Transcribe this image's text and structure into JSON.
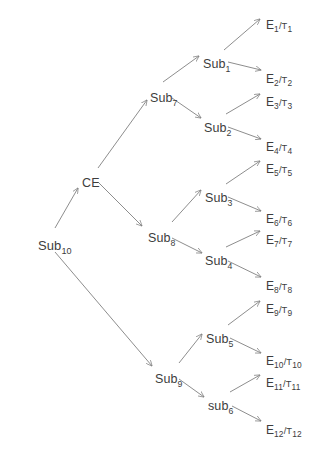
{
  "diagram": {
    "type": "tree",
    "background_color": "#ffffff",
    "text_color": "#3d3d3d",
    "edge_color": "#808080",
    "nodes": [
      {
        "id": "sub10",
        "label_prefix": "Sub",
        "label_sub": "10",
        "text": "Sub10",
        "kind": "root",
        "x": 38,
        "y": 239
      },
      {
        "id": "ce",
        "label_prefix": "CE",
        "label_sub": "",
        "text": "CE",
        "kind": "internal",
        "x": 82,
        "y": 177
      },
      {
        "id": "sub9",
        "label_prefix": "Sub",
        "label_sub": "9",
        "text": "Sub9",
        "kind": "internal",
        "x": 155,
        "y": 373
      },
      {
        "id": "sub7",
        "label_prefix": "Sub",
        "label_sub": "7",
        "text": "Sub7",
        "kind": "internal",
        "x": 150,
        "y": 92
      },
      {
        "id": "sub8",
        "label_prefix": "Sub",
        "label_sub": "8",
        "text": "Sub8",
        "kind": "internal",
        "x": 148,
        "y": 232
      },
      {
        "id": "sub1",
        "label_prefix": "Sub",
        "label_sub": "1",
        "text": "Sub1",
        "kind": "internal",
        "x": 203,
        "y": 58
      },
      {
        "id": "sub2",
        "label_prefix": "Sub",
        "label_sub": "2",
        "text": "Sub2",
        "kind": "internal",
        "x": 204,
        "y": 122
      },
      {
        "id": "sub3",
        "label_prefix": "Sub",
        "label_sub": "3",
        "text": "Sub3",
        "kind": "internal",
        "x": 205,
        "y": 192
      },
      {
        "id": "sub4",
        "label_prefix": "Sub",
        "label_sub": "4",
        "text": "Sub4",
        "kind": "internal",
        "x": 205,
        "y": 255
      },
      {
        "id": "sub5",
        "label_prefix": "Sub",
        "label_sub": "5",
        "text": "Sub5",
        "kind": "internal",
        "x": 206,
        "y": 333
      },
      {
        "id": "sub6",
        "label_prefix": "sub",
        "label_sub": "6",
        "text": "sub6",
        "kind": "internal",
        "x": 208,
        "y": 400
      }
    ],
    "leaves": [
      {
        "id": "e1",
        "e": "E",
        "e_sub": "1",
        "t": "T",
        "t_sub": "1",
        "text": "E1/T1",
        "x": 266,
        "y": 19
      },
      {
        "id": "e2",
        "e": "E",
        "e_sub": "2",
        "t": "T",
        "t_sub": "2",
        "text": "E2/T2",
        "x": 266,
        "y": 73
      },
      {
        "id": "e3",
        "e": "E",
        "e_sub": "3",
        "t": "T",
        "t_sub": "3",
        "text": "E3/T3",
        "x": 266,
        "y": 96
      },
      {
        "id": "e4",
        "e": "E",
        "e_sub": "4",
        "t": "T",
        "t_sub": "4",
        "text": "E4/T4",
        "x": 266,
        "y": 141
      },
      {
        "id": "e5",
        "e": "E",
        "e_sub": "5",
        "t": "T",
        "t_sub": "5",
        "text": "E5/T5",
        "x": 266,
        "y": 163
      },
      {
        "id": "e6",
        "e": "E",
        "e_sub": "6",
        "t": "T",
        "t_sub": "6",
        "text": "E6/T6",
        "x": 266,
        "y": 213
      },
      {
        "id": "e7",
        "e": "E",
        "e_sub": "7",
        "t": "T",
        "t_sub": "7",
        "text": "E7/T7",
        "x": 266,
        "y": 234
      },
      {
        "id": "e8",
        "e": "E",
        "e_sub": "8",
        "t": "T",
        "t_sub": "8",
        "text": "E8/T8",
        "x": 266,
        "y": 280
      },
      {
        "id": "e9",
        "e": "E",
        "e_sub": "9",
        "t": "T",
        "t_sub": "9",
        "text": "E9/T9",
        "x": 266,
        "y": 303
      },
      {
        "id": "e10",
        "e": "E",
        "e_sub": "10",
        "t": "T",
        "t_sub": "10",
        "text": "E10/T10",
        "x": 266,
        "y": 355
      },
      {
        "id": "e11",
        "e": "E",
        "e_sub": "11",
        "t": "T",
        "t_sub": "11",
        "text": "E11/T11",
        "x": 266,
        "y": 377
      },
      {
        "id": "e12",
        "e": "E",
        "e_sub": "12",
        "t": "T",
        "t_sub": "12",
        "text": "E12/T12",
        "x": 266,
        "y": 424
      }
    ],
    "edges": [
      {
        "from": "sub10",
        "to": "ce",
        "x1": 55,
        "y1": 228,
        "x2": 78,
        "y2": 188
      },
      {
        "from": "sub10",
        "to": "sub9",
        "x1": 55,
        "y1": 252,
        "x2": 152,
        "y2": 366
      },
      {
        "from": "ce",
        "to": "sub7",
        "x1": 98,
        "y1": 168,
        "x2": 147,
        "y2": 100
      },
      {
        "from": "ce",
        "to": "sub8",
        "x1": 98,
        "y1": 182,
        "x2": 142,
        "y2": 226
      },
      {
        "from": "sub7",
        "to": "sub1",
        "x1": 163,
        "y1": 82,
        "x2": 199,
        "y2": 56
      },
      {
        "from": "sub7",
        "to": "sub2",
        "x1": 172,
        "y1": 98,
        "x2": 201,
        "y2": 118
      },
      {
        "from": "sub8",
        "to": "sub3",
        "x1": 172,
        "y1": 222,
        "x2": 201,
        "y2": 190
      },
      {
        "from": "sub8",
        "to": "sub4",
        "x1": 172,
        "y1": 238,
        "x2": 202,
        "y2": 253
      },
      {
        "from": "sub9",
        "to": "sub5",
        "x1": 179,
        "y1": 363,
        "x2": 202,
        "y2": 334
      },
      {
        "from": "sub9",
        "to": "sub6",
        "x1": 179,
        "y1": 379,
        "x2": 204,
        "y2": 397
      },
      {
        "from": "sub1",
        "to": "e1",
        "x1": 224,
        "y1": 50,
        "x2": 260,
        "y2": 19
      },
      {
        "from": "sub1",
        "to": "e2",
        "x1": 228,
        "y1": 62,
        "x2": 261,
        "y2": 70
      },
      {
        "from": "sub2",
        "to": "e3",
        "x1": 226,
        "y1": 114,
        "x2": 260,
        "y2": 94
      },
      {
        "from": "sub2",
        "to": "e4",
        "x1": 228,
        "y1": 127,
        "x2": 261,
        "y2": 139
      },
      {
        "from": "sub3",
        "to": "e5",
        "x1": 226,
        "y1": 184,
        "x2": 260,
        "y2": 161
      },
      {
        "from": "sub3",
        "to": "e6",
        "x1": 228,
        "y1": 197,
        "x2": 261,
        "y2": 211
      },
      {
        "from": "sub4",
        "to": "e7",
        "x1": 226,
        "y1": 247,
        "x2": 260,
        "y2": 231
      },
      {
        "from": "sub4",
        "to": "e8",
        "x1": 228,
        "y1": 261,
        "x2": 261,
        "y2": 277
      },
      {
        "from": "sub5",
        "to": "e9",
        "x1": 228,
        "y1": 325,
        "x2": 260,
        "y2": 301
      },
      {
        "from": "sub5",
        "to": "e10",
        "x1": 230,
        "y1": 338,
        "x2": 261,
        "y2": 353
      },
      {
        "from": "sub6",
        "to": "e11",
        "x1": 230,
        "y1": 392,
        "x2": 260,
        "y2": 375
      },
      {
        "from": "sub6",
        "to": "e12",
        "x1": 232,
        "y1": 406,
        "x2": 261,
        "y2": 421
      }
    ]
  }
}
